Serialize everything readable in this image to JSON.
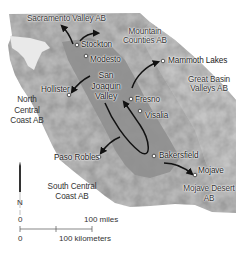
{
  "map": {
    "title": "Central California air basins and pollution transport",
    "colors": {
      "background": "#ffffff",
      "terrain": "#b8b8b8",
      "terrain_light": "#d4d4d4",
      "valley": "#8e8e8e",
      "arrow": "#111111",
      "city_marker_fill": "#ffffff",
      "city_marker_stroke": "#333333"
    },
    "cities": [
      {
        "name": "Stockton",
        "x": 77,
        "y": 45
      },
      {
        "name": "Modesto",
        "x": 86,
        "y": 56
      },
      {
        "name": "Mammoth Lakes",
        "x": 163,
        "y": 61
      },
      {
        "name": "Hollister",
        "x": 69,
        "y": 95
      },
      {
        "name": "Fresno",
        "x": 131,
        "y": 99
      },
      {
        "name": "Visalia",
        "x": 140,
        "y": 111
      },
      {
        "name": "Bakersfield",
        "x": 154,
        "y": 156
      },
      {
        "name": "Paso Robles",
        "x": 99,
        "y": 157
      },
      {
        "name": "Mojave",
        "x": 195,
        "y": 175
      }
    ],
    "air_basins": [
      {
        "name": "Sacramento Valley AB"
      },
      {
        "name_line1": "Mountain",
        "name_line2": "Counties AB"
      },
      {
        "name_line1": "Great Basin",
        "name_line2": "Valleys AB"
      },
      {
        "name_line1": "North",
        "name_line2": "Central",
        "name_line3": "Coast AB"
      },
      {
        "name_line1": "South Central",
        "name_line2": "Coast AB"
      },
      {
        "name_line1": "Mojave Desert",
        "name_line2": "AB"
      }
    ],
    "valley_label": {
      "line1": "San",
      "line2": "Joaquin",
      "line3": "Valley"
    },
    "north_arrow": {
      "label": "N"
    },
    "scale_bar": {
      "miles_zero": "0",
      "miles_label": "100 miles",
      "km_zero": "0",
      "km_label": "100 kilometers"
    }
  }
}
